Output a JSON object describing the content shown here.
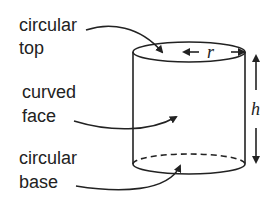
{
  "labels": {
    "circular_top": [
      "circular",
      "top"
    ],
    "curved_face": [
      "curved",
      "face"
    ],
    "circular_base": [
      "circular",
      "base"
    ]
  },
  "variables": {
    "radius": "r",
    "height": "h"
  },
  "colors": {
    "stroke": "#222222",
    "background": "#ffffff"
  }
}
